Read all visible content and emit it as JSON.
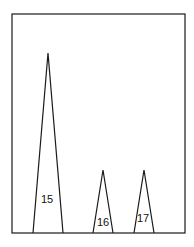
{
  "chart_data": {
    "type": "area",
    "title": "",
    "xlabel": "",
    "ylabel": "",
    "grid": false,
    "legend": null,
    "frame": {
      "left": 12,
      "top": 14,
      "right": 185,
      "bottom": 233
    },
    "peaks": [
      {
        "label": "15",
        "apex_x": 48,
        "apex_y": 53,
        "base_left": 33,
        "base_right": 63,
        "label_x": 47,
        "label_y": 203,
        "relative_height": 1.0
      },
      {
        "label": "16",
        "apex_x": 103,
        "apex_y": 170,
        "base_left": 93,
        "base_right": 113,
        "label_x": 103,
        "label_y": 226,
        "relative_height": 0.35
      },
      {
        "label": "17",
        "apex_x": 144,
        "apex_y": 170,
        "base_left": 134,
        "base_right": 154,
        "label_x": 143,
        "label_y": 222,
        "relative_height": 0.35
      }
    ],
    "colors": {
      "line": "#1a1a1a",
      "background": "#ffffff"
    }
  }
}
